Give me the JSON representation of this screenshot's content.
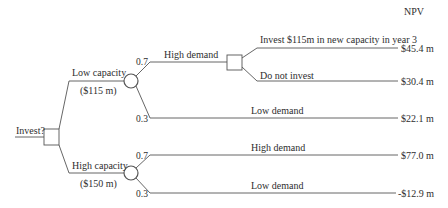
{
  "header": {
    "npv_label": "NPV"
  },
  "root": {
    "label": "Invest?"
  },
  "branches": {
    "low_capacity": {
      "label": "Low capacity",
      "cost": "($115 m)",
      "high_demand": {
        "probability": "0.7",
        "label": "High demand",
        "options": {
          "invest": {
            "label": "Invest $115m in new capacity in year 3",
            "npv": "$45.4 m"
          },
          "no_invest": {
            "label": "Do not invest",
            "npv": "$30.4 m"
          }
        }
      },
      "low_demand": {
        "probability": "0.3",
        "label": "Low demand",
        "npv": "$22.1 m"
      }
    },
    "high_capacity": {
      "label": "High capacity",
      "cost": "($150 m)",
      "high_demand": {
        "probability": "0.7",
        "label": "High demand",
        "npv": "$77.0 m"
      },
      "low_demand": {
        "probability": "0.3",
        "label": "Low demand",
        "npv": "-$12.9 m"
      }
    }
  },
  "colors": {
    "line": "#555555",
    "text": "#2e2e2e",
    "background": "#ffffff"
  }
}
